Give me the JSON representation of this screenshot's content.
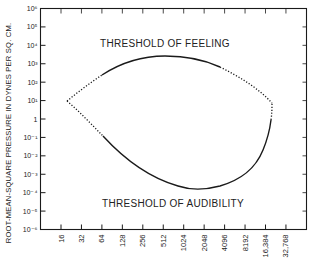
{
  "chart_data": {
    "type": "line",
    "title": "",
    "xlabel": "",
    "ylabel": "ROOT-MEAN-SQUARE PRESSURE IN DYNES PER SQ. CM.",
    "x_scale": "log2",
    "y_scale": "log10",
    "x_ticks": [
      "16",
      "32",
      "64",
      "128",
      "256",
      "512",
      "1024",
      "2048",
      "4096",
      "8192",
      "16,384",
      "32,768"
    ],
    "x_tick_values": [
      16,
      32,
      64,
      128,
      256,
      512,
      1024,
      2048,
      4096,
      8192,
      16384,
      32768
    ],
    "y_ticks": [
      "10⁶",
      "10⁵",
      "10⁴",
      "10³",
      "10²",
      "10¹",
      "1",
      "10⁻¹",
      "10⁻²",
      "10⁻³",
      "10⁻⁴",
      "10⁻⁵",
      "10⁻⁶"
    ],
    "y_tick_exponents": [
      6,
      5,
      4,
      3,
      2,
      1,
      0,
      -1,
      -2,
      -3,
      -4,
      -5,
      -6
    ],
    "ylim": [
      1e-06,
      1000000
    ],
    "xlim": [
      11,
      42000
    ],
    "grid": false,
    "annotations": [
      {
        "text": "THRESHOLD OF FEELING",
        "x": 400,
        "y": 10000
      },
      {
        "text": "THRESHOLD OF AUDIBILITY",
        "x": 1000,
        "y": 2e-05
      }
    ],
    "series": [
      {
        "name": "Threshold of Feeling",
        "style": "solid with dotted extrapolated ends",
        "points": [
          {
            "f": 20,
            "p": 10,
            "dotted": true
          },
          {
            "f": 60,
            "p": 300,
            "dotted": true
          },
          {
            "f": 100,
            "p": 800,
            "dotted": false
          },
          {
            "f": 250,
            "p": 1800,
            "dotted": false
          },
          {
            "f": 550,
            "p": 2500,
            "dotted": false
          },
          {
            "f": 1200,
            "p": 2000,
            "dotted": false
          },
          {
            "f": 2600,
            "p": 1000,
            "dotted": false
          },
          {
            "f": 6000,
            "p": 250,
            "dotted": true
          },
          {
            "f": 20000,
            "p": 7,
            "dotted": true
          }
        ]
      },
      {
        "name": "Threshold of Audibility",
        "style": "solid with dotted extrapolated ends",
        "points": [
          {
            "f": 20,
            "p": 10,
            "dotted": true
          },
          {
            "f": 40,
            "p": 0.5,
            "dotted": true
          },
          {
            "f": 60,
            "p": 0.1,
            "dotted": false
          },
          {
            "f": 128,
            "p": 0.01,
            "dotted": false
          },
          {
            "f": 300,
            "p": 0.0015,
            "dotted": false
          },
          {
            "f": 800,
            "p": 0.0004,
            "dotted": false
          },
          {
            "f": 1800,
            "p": 0.00016,
            "dotted": false
          },
          {
            "f": 4000,
            "p": 0.0003,
            "dotted": false
          },
          {
            "f": 10000,
            "p": 0.002,
            "dotted": false
          },
          {
            "f": 16000,
            "p": 0.05,
            "dotted": false
          },
          {
            "f": 19500,
            "p": 1,
            "dotted": true
          },
          {
            "f": 20000,
            "p": 7,
            "dotted": true
          }
        ]
      }
    ]
  },
  "colors": {
    "ink": "#1a1a1a",
    "background": "#ffffff"
  }
}
